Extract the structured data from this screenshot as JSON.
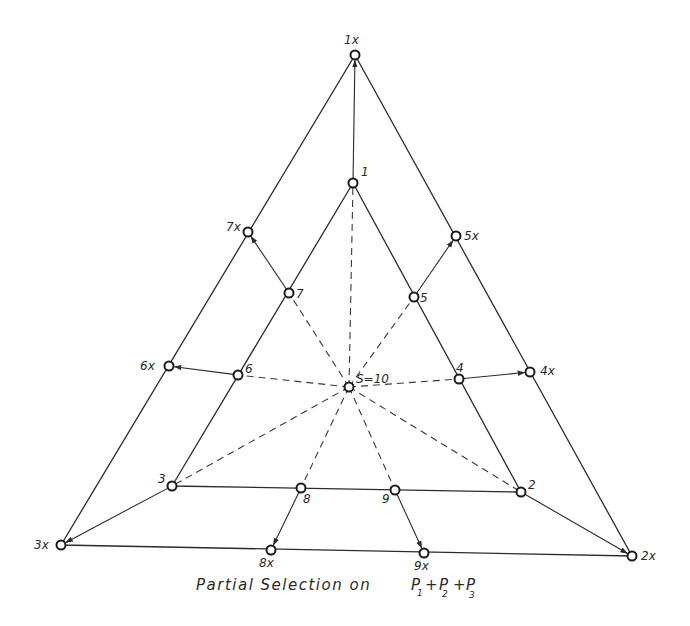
{
  "diagram": {
    "caption": "Partial Selection on P1 + P2 + P3",
    "caption_parts": {
      "text": "Partial  Selection  on",
      "p1": "P",
      "p1_sub": "1",
      "plus1": "+",
      "p2": "P",
      "p2_sub": "2",
      "plus2": "+",
      "p3": "P",
      "p3_sub": "3"
    },
    "center": {
      "id": "S",
      "label": "S=10",
      "x": 349,
      "y": 387
    },
    "inner_triangle": [
      {
        "id": "1",
        "label": "1",
        "x": 353,
        "y": 183
      },
      {
        "id": "2",
        "label": "2",
        "x": 521,
        "y": 492
      },
      {
        "id": "3",
        "label": "3",
        "x": 172,
        "y": 486
      }
    ],
    "outer_triangle": [
      {
        "id": "1x",
        "label": "1x",
        "x": 355,
        "y": 55
      },
      {
        "id": "2x",
        "label": "2x",
        "x": 632,
        "y": 556
      },
      {
        "id": "3x",
        "label": "3x",
        "x": 61,
        "y": 545
      }
    ],
    "inner_edge_points": [
      {
        "id": "4",
        "label": "4",
        "x": 459,
        "y": 379
      },
      {
        "id": "5",
        "label": "5",
        "x": 414,
        "y": 297
      },
      {
        "id": "6",
        "label": "6",
        "x": 238,
        "y": 375
      },
      {
        "id": "7",
        "label": "7",
        "x": 289,
        "y": 293
      },
      {
        "id": "8",
        "label": "8",
        "x": 301,
        "y": 488
      },
      {
        "id": "9",
        "label": "9",
        "x": 395,
        "y": 490
      }
    ],
    "outer_edge_points": [
      {
        "id": "4x",
        "label": "4x",
        "x": 530,
        "y": 372
      },
      {
        "id": "5x",
        "label": "5x",
        "x": 456,
        "y": 236
      },
      {
        "id": "6x",
        "label": "6x",
        "x": 169,
        "y": 366
      },
      {
        "id": "7x",
        "label": "7x",
        "x": 248,
        "y": 232
      },
      {
        "id": "8x",
        "label": "8x",
        "x": 271,
        "y": 550
      },
      {
        "id": "9x",
        "label": "9x",
        "x": 424,
        "y": 553
      }
    ],
    "arrows": [
      {
        "from": "1",
        "to": "1x"
      },
      {
        "from": "2",
        "to": "2x"
      },
      {
        "from": "3",
        "to": "3x"
      },
      {
        "from": "4",
        "to": "4x"
      },
      {
        "from": "5",
        "to": "5x"
      },
      {
        "from": "6",
        "to": "6x"
      },
      {
        "from": "7",
        "to": "7x"
      },
      {
        "from": "8",
        "to": "8x"
      },
      {
        "from": "9",
        "to": "9x"
      }
    ],
    "dashed_from_center_to": [
      "1",
      "2",
      "3",
      "4",
      "5",
      "6",
      "7",
      "8",
      "9"
    ]
  }
}
